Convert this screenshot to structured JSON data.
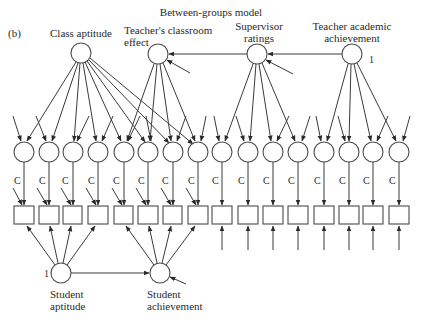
{
  "title": "Between-groups model",
  "panel_label": "(b)",
  "colors": {
    "stroke": "#3a3a3a",
    "node_fill": "#ffffff",
    "text": "#2a2a2a"
  },
  "latent_top": [
    {
      "id": "class_aptitude",
      "label_lines": [
        "Class aptitude"
      ],
      "cx": 81,
      "cy": 53
    },
    {
      "id": "teacher_classroom",
      "label_lines": [
        "Teacher's classroom",
        "effect"
      ],
      "cx": 158,
      "cy": 54
    },
    {
      "id": "supervisor",
      "label_lines": [
        "Supervisor",
        "ratings"
      ],
      "cx": 257,
      "cy": 54
    },
    {
      "id": "teacher_academic",
      "label_lines": [
        "Teacher academic",
        "achievement"
      ],
      "cx": 352,
      "cy": 54,
      "annotation": "1"
    }
  ],
  "latent_bottom": [
    {
      "id": "student_aptitude",
      "label_lines": [
        "Student",
        "aptitude"
      ],
      "cx": 61,
      "cy": 273,
      "annotation": "1"
    },
    {
      "id": "student_achievement",
      "label_lines": [
        "Student",
        "achievement"
      ],
      "cx": 160,
      "cy": 273
    }
  ],
  "residual_circles_x": [
    24,
    49,
    73,
    98,
    124,
    148,
    173,
    198,
    222,
    248,
    273,
    298,
    324,
    349,
    373,
    399
  ],
  "residual_circle_y": 152,
  "indicator_box_y": [
    206,
    224
  ],
  "loading_label": "C",
  "structural_paths": [
    {
      "from": "teacher_academic",
      "to": "supervisor"
    },
    {
      "from": "supervisor",
      "to": "teacher_classroom"
    },
    {
      "from": "student_aptitude",
      "to": "student_achievement"
    }
  ],
  "loadings_from_top": {
    "class_aptitude": [
      1,
      2,
      3,
      4,
      5,
      6,
      7,
      8
    ],
    "teacher_classroom": [
      5,
      6,
      7,
      8
    ],
    "supervisor": [
      9,
      10,
      11,
      12
    ],
    "teacher_academic": [
      13,
      14,
      15,
      16
    ]
  },
  "loadings_from_bottom": {
    "student_aptitude": [
      1,
      2,
      3,
      4
    ],
    "student_achievement": [
      5,
      6,
      7,
      8
    ]
  }
}
